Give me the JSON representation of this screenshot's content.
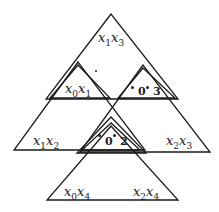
{
  "diagram": {
    "labels": {
      "top": {
        "var1": "x",
        "sub1": "1",
        "var2": "x",
        "sub2": "3"
      },
      "left_small": {
        "var1": "x",
        "sub1": "0",
        "var2": "x",
        "sub2": "1"
      },
      "middle_left": {
        "var1": "x",
        "sub1": "1",
        "var2": "x",
        "sub2": "2"
      },
      "middle_right": {
        "var1": "x",
        "sub1": "2",
        "var2": "x",
        "sub2": "3"
      },
      "bottom_left": {
        "var1": "x",
        "sub1": "0",
        "var2": "x",
        "sub2": "4"
      },
      "bottom_right": {
        "var1": "x",
        "sub1": "2",
        "var2": "x",
        "sub2": "4"
      }
    },
    "upper_small_numbers": {
      "a": "0",
      "b": "3"
    },
    "center_small_numbers": {
      "a": "0",
      "b": "2"
    },
    "line_color": "#1a1a1a"
  }
}
